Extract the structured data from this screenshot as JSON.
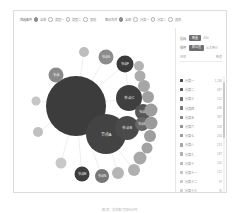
{
  "card": {
    "toolbar": {
      "filters": [
        {
          "label": "筛选条件",
          "options": [
            {
              "text": "全部",
              "selected": true
            },
            {
              "text": "类型一",
              "selected": false
            },
            {
              "text": "类型二",
              "selected": false
            },
            {
              "text": "其他",
              "selected": false
            }
          ]
        },
        {
          "label": "显示方式",
          "options": [
            {
              "text": "全部",
              "selected": true
            },
            {
              "text": "分类一",
              "selected": false
            },
            {
              "text": "分类二",
              "selected": false
            },
            {
              "text": "其他",
              "selected": false
            }
          ]
        }
      ]
    },
    "sidebar": {
      "toggles": [
        {
          "name": "指标",
          "pill": "数量",
          "value": "占比"
        },
        {
          "name": "排序",
          "pill": "默认值",
          "value": "从大到小"
        }
      ],
      "list_header": {
        "name_col": "名称",
        "value_col": "数值"
      },
      "rows": [
        {
          "color": "#4a4a4a",
          "name": "分类一",
          "value": "1,280"
        },
        {
          "color": "#585858",
          "name": "分类二",
          "value": "687"
        },
        {
          "color": "#6a6a6a",
          "name": "分类三",
          "value": "512"
        },
        {
          "color": "#777777",
          "name": "分类四",
          "value": "430"
        },
        {
          "color": "#848484",
          "name": "分类五",
          "value": "367"
        },
        {
          "color": "#909090",
          "name": "分类六",
          "value": "318"
        },
        {
          "color": "#9b9b9b",
          "name": "分类七",
          "value": "264"
        },
        {
          "color": "#a6a6a6",
          "name": "分类八",
          "value": "213"
        },
        {
          "color": "#b0b0b0",
          "name": "分类九",
          "value": "187"
        },
        {
          "color": "#bababa",
          "name": "分类十",
          "value": "152"
        },
        {
          "color": "#c3c3c3",
          "name": "分类十一",
          "value": "121"
        },
        {
          "color": "#cbcbcb",
          "name": "分类十二",
          "value": "97"
        },
        {
          "color": "#d2d2d2",
          "name": "分类十三",
          "value": "76"
        }
      ]
    }
  },
  "caption": "图表：关系图可视化示例",
  "chart_data": {
    "type": "scatter",
    "title": "",
    "xlabel": "",
    "ylabel": "",
    "layout": "force-directed bubble network",
    "nodes": [
      {
        "id": "n1",
        "label": "中心节点",
        "x": 62,
        "y": 78,
        "r": 30,
        "color": "#3c3c3c",
        "fontsize": 0
      },
      {
        "id": "n2",
        "label": "节点A",
        "x": 92,
        "y": 106,
        "r": 20,
        "color": "#434343",
        "fontsize": 4
      },
      {
        "id": "n3",
        "label": "节点B",
        "x": 113,
        "y": 100,
        "r": 12,
        "color": "#4a4a4a",
        "fontsize": 3.6
      },
      {
        "id": "n4",
        "label": "节点C",
        "x": 115,
        "y": 70,
        "r": 13,
        "color": "#3f3f3f",
        "fontsize": 3.6
      },
      {
        "id": "n5",
        "label": "节点D",
        "x": 129,
        "y": 84,
        "r": 8,
        "color": "#565656",
        "fontsize": 3.2
      },
      {
        "id": "n6",
        "label": "节点E",
        "x": 128,
        "y": 96,
        "r": 7,
        "color": "#676767",
        "fontsize": 3
      },
      {
        "id": "n7",
        "label": "节点F",
        "x": 111,
        "y": 36,
        "r": 8.5,
        "color": "#3a3a3a",
        "fontsize": 3.2
      },
      {
        "id": "n8",
        "label": "节点G",
        "x": 92,
        "y": 29,
        "r": 7.5,
        "color": "#8c8c8c",
        "fontsize": 3
      },
      {
        "id": "n9",
        "label": "节点H",
        "x": 70,
        "y": 24,
        "r": 5,
        "color": "#bdbdbd",
        "fontsize": 0
      },
      {
        "id": "n10",
        "label": "节点I",
        "x": 42,
        "y": 47,
        "r": 7.5,
        "color": "#8a8a8a",
        "fontsize": 3
      },
      {
        "id": "n11",
        "label": "节点J",
        "x": 22,
        "y": 73,
        "r": 4.5,
        "color": "#c6c6c6",
        "fontsize": 0
      },
      {
        "id": "n12",
        "label": "节点K",
        "x": 24,
        "y": 104,
        "r": 5,
        "color": "#c0c0c0",
        "fontsize": 0
      },
      {
        "id": "n13",
        "label": "节点L",
        "x": 47,
        "y": 135,
        "r": 5.5,
        "color": "#c8c8c8",
        "fontsize": 0
      },
      {
        "id": "n14",
        "label": "节点M",
        "x": 68,
        "y": 146,
        "r": 7.5,
        "color": "#3d3d3d",
        "fontsize": 3
      },
      {
        "id": "n15",
        "label": "节点N",
        "x": 88,
        "y": 148,
        "r": 7,
        "color": "#777777",
        "fontsize": 3
      },
      {
        "id": "n16",
        "label": "节点O",
        "x": 104,
        "y": 145,
        "r": 6,
        "color": "#b5b5b5",
        "fontsize": 0
      },
      {
        "id": "n17",
        "label": "节点P",
        "x": 120,
        "y": 142,
        "r": 6,
        "color": "#b0b0b0",
        "fontsize": 0
      },
      {
        "id": "n18",
        "label": "节点Q",
        "x": 126,
        "y": 130,
        "r": 6.5,
        "color": "#a8a8a8",
        "fontsize": 0
      },
      {
        "id": "n19",
        "label": "节点R",
        "x": 133,
        "y": 120,
        "r": 5.5,
        "color": "#a2a2a2",
        "fontsize": 0
      },
      {
        "id": "n20",
        "label": "节点S",
        "x": 136,
        "y": 108,
        "r": 6,
        "color": "#9e9e9e",
        "fontsize": 0
      },
      {
        "id": "n21",
        "label": "节点T",
        "x": 137,
        "y": 95,
        "r": 6.5,
        "color": "#9a9a9a",
        "fontsize": 0
      },
      {
        "id": "n22",
        "label": "节点U",
        "x": 137,
        "y": 82,
        "r": 6.5,
        "color": "#9c9c9c",
        "fontsize": 0
      },
      {
        "id": "n23",
        "label": "节点V",
        "x": 134,
        "y": 69,
        "r": 6,
        "color": "#a0a0a0",
        "fontsize": 0
      },
      {
        "id": "n24",
        "label": "节点W",
        "x": 130,
        "y": 58,
        "r": 6,
        "color": "#a6a6a6",
        "fontsize": 0
      },
      {
        "id": "n25",
        "label": "节点X",
        "x": 126,
        "y": 48,
        "r": 5.5,
        "color": "#acacac",
        "fontsize": 0
      },
      {
        "id": "n26",
        "label": "节点Y",
        "x": 125,
        "y": 38,
        "r": 5,
        "color": "#b4b4b4",
        "fontsize": 0
      }
    ],
    "edges": [
      {
        "source": "n1",
        "target": "n2"
      },
      {
        "source": "n1",
        "target": "n4"
      },
      {
        "source": "n1",
        "target": "n7"
      },
      {
        "source": "n1",
        "target": "n8"
      },
      {
        "source": "n1",
        "target": "n9"
      },
      {
        "source": "n1",
        "target": "n10"
      },
      {
        "source": "n1",
        "target": "n11"
      },
      {
        "source": "n1",
        "target": "n12"
      },
      {
        "source": "n1",
        "target": "n13"
      },
      {
        "source": "n1",
        "target": "n14"
      },
      {
        "source": "n1",
        "target": "n15"
      },
      {
        "source": "n1",
        "target": "n3"
      },
      {
        "source": "n2",
        "target": "n3"
      },
      {
        "source": "n2",
        "target": "n16"
      },
      {
        "source": "n2",
        "target": "n17"
      },
      {
        "source": "n4",
        "target": "n7"
      },
      {
        "source": "n4",
        "target": "n5"
      },
      {
        "source": "n7",
        "target": "n26"
      },
      {
        "source": "n3",
        "target": "n20"
      }
    ]
  }
}
